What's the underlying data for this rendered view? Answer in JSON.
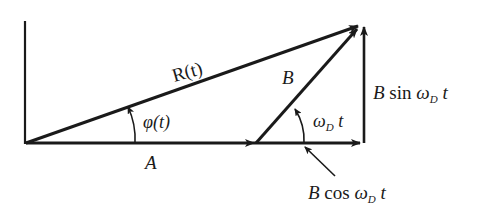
{
  "diagram": {
    "type": "phasor-diagram",
    "stroke_color": "#1a1a1a",
    "labels": {
      "R": "R(t)",
      "phi": "φ(t)",
      "A": "A",
      "B": "B",
      "omega": "ω",
      "omega_sub": "D",
      "t": " t",
      "B_sin_prefix": "B",
      "sin": " sin ",
      "B_cos_prefix": "B",
      "cos": " cos "
    }
  }
}
